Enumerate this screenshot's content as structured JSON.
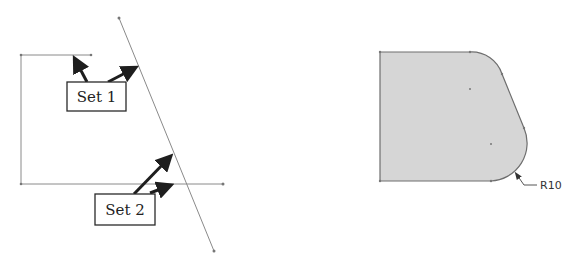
{
  "left_figure": {
    "description": "Sketch lines with two selection sets",
    "labels": [
      {
        "id": "set1",
        "text": "Set 1"
      },
      {
        "id": "set2",
        "text": "Set 2"
      }
    ]
  },
  "right_figure": {
    "description": "Filleted shaded profile",
    "dimension_label": "R10"
  },
  "colors": {
    "line": "#8a8a8a",
    "arrow": "#1e1e1e",
    "shape_fill": "#d6d6d6",
    "shape_stroke": "#6e6e6e"
  }
}
